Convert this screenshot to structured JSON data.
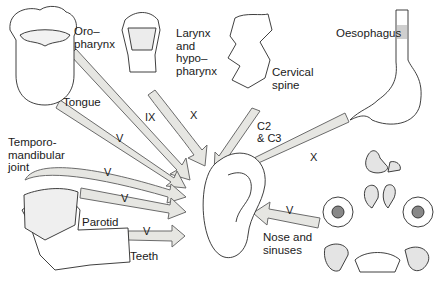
{
  "colors": {
    "arrow_fill": "#e6e6e2",
    "arrow_stroke": "#6b6b6b",
    "line": "#2a2a2a"
  },
  "center": {
    "name": "Ear"
  },
  "sources": [
    {
      "id": "oropharynx",
      "label": "Oro–\npharynx",
      "nerve": "IX"
    },
    {
      "id": "larynx",
      "label": "Larynx\nand\nhypo–\npharynx",
      "nerve": "X"
    },
    {
      "id": "cervical",
      "label": "Cervical\nspine",
      "nerve": "C2\n& C3"
    },
    {
      "id": "oesophagus",
      "label": "Oesophagus",
      "nerve": "X"
    },
    {
      "id": "tongue",
      "label": "Tongue",
      "nerve": "V"
    },
    {
      "id": "tmj",
      "label": "Temporo-\nmandibular\njoint",
      "nerve": "V"
    },
    {
      "id": "parotid",
      "label": "Parotid",
      "nerve": "V"
    },
    {
      "id": "teeth",
      "label": "Teeth",
      "nerve": "V"
    },
    {
      "id": "nose",
      "label": "Nose and\nsinuses",
      "nerve": "V"
    }
  ]
}
